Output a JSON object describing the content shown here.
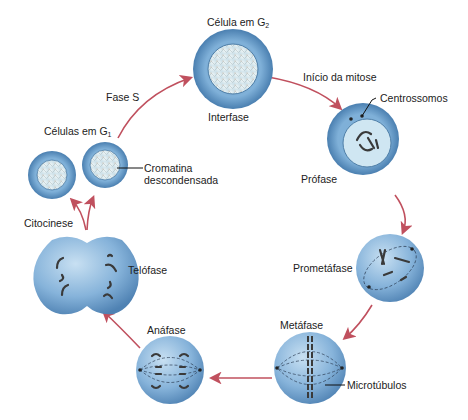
{
  "diagram": {
    "stages": [
      {
        "id": "g2",
        "label": "Célula em G",
        "subscript": "2",
        "phase_label": "Interfase"
      },
      {
        "id": "prophase",
        "label": "Prófase"
      },
      {
        "id": "prometaphase",
        "label": "Prometáfase"
      },
      {
        "id": "metaphase",
        "label": "Metáfase"
      },
      {
        "id": "anaphase",
        "label": "Anáfase"
      },
      {
        "id": "telophase",
        "label": "Telófase"
      },
      {
        "id": "g1",
        "label": "Células em G",
        "subscript": "1"
      }
    ],
    "transitions": [
      {
        "label": "Fase S"
      },
      {
        "label": "Início da mitose"
      },
      {
        "label": "Citocinese"
      }
    ],
    "callouts": {
      "centrosomes": "Centrossomos",
      "chromatin_line1": "Cromatina",
      "chromatin_line2": "descondensada",
      "microtubules": "Microtúbulos"
    },
    "colors": {
      "cell_outer": "#5b8fbf",
      "cell_inner": "#a9cbe6",
      "nucleus": "#dceaf2",
      "arrow": "#c0505e",
      "chromosome": "#3a3a3a"
    }
  }
}
